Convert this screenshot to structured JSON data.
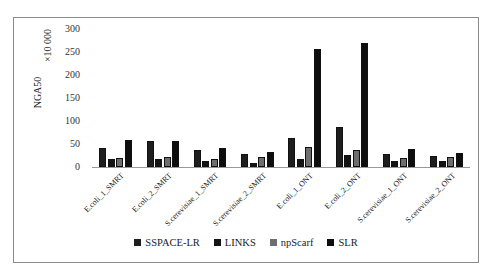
{
  "chart_data": {
    "type": "bar",
    "title": "",
    "xlabel": "",
    "ylabel": "NGA50",
    "yunit": "×10 000",
    "ylim": [
      0,
      300
    ],
    "yticks": [
      0,
      50,
      100,
      150,
      200,
      250,
      300
    ],
    "grid": false,
    "legend_position": "bottom",
    "categories": [
      "E.coli_1_SMRT",
      "E.coli_2_SMRT",
      "S.cerevisiae_1_SMRT",
      "S.cerevisiae_2_SMRT",
      "E.coli_1_ONT",
      "E.coli_2_ONT",
      "S.cerevisiae_1_ONT",
      "S.cerevisiae_2_ONT"
    ],
    "series": [
      {
        "name": "SSPACE-LR",
        "color": "#1e1e1e",
        "values": [
          42,
          56,
          38,
          28,
          63,
          86,
          28,
          25
        ]
      },
      {
        "name": "LINKS",
        "color": "#141414",
        "values": [
          17,
          17,
          14,
          9,
          18,
          27,
          14,
          12
        ]
      },
      {
        "name": "npScarf",
        "color": "#6e6e6e",
        "values": [
          20,
          21,
          18,
          22,
          43,
          38,
          20,
          22
        ]
      },
      {
        "name": "SLR",
        "color": "#0e0e0e",
        "values": [
          59,
          57,
          41,
          32,
          256,
          270,
          40,
          30
        ]
      }
    ]
  }
}
